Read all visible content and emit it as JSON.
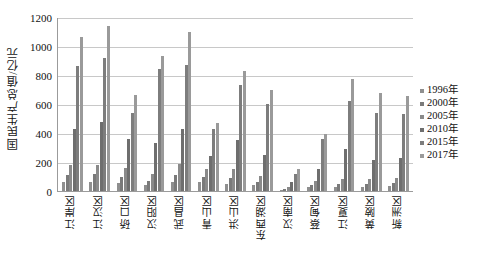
{
  "chart_data": {
    "type": "bar",
    "title": "",
    "subtitle": "",
    "xlabel": "",
    "ylabel": "国民生产总值/亿元",
    "ylim": [
      0,
      1200
    ],
    "ytick_values": [
      0,
      200,
      400,
      600,
      800,
      1000,
      1200
    ],
    "ytick_labels": [
      "0",
      "200",
      "400",
      "600",
      "800",
      "1000",
      "1200"
    ],
    "grid": true,
    "legend_position": "right",
    "categories": [
      "江岸区",
      "江汉区",
      "硚口区",
      "汉阳区",
      "武昌区",
      "青山区",
      "洪山区",
      "东西湖区",
      "汉南区",
      "蔡甸区",
      "江夏区",
      "黄陂区",
      "新洲区"
    ],
    "series": [
      {
        "name": "1996年",
        "color": "#8f8f8f",
        "values": [
          60,
          64,
          55,
          42,
          62,
          60,
          50,
          40,
          10,
          26,
          30,
          30,
          34
        ]
      },
      {
        "name": "2000年",
        "color": "#7a7a7a",
        "values": [
          110,
          120,
          100,
          70,
          110,
          100,
          88,
          62,
          14,
          40,
          46,
          48,
          52
        ]
      },
      {
        "name": "2005年",
        "color": "#8a8a8a",
        "values": [
          180,
          180,
          160,
          120,
          185,
          150,
          150,
          105,
          26,
          72,
          80,
          85,
          90
        ]
      },
      {
        "name": "2010年",
        "color": "#6e6e6e",
        "values": [
          425,
          475,
          360,
          330,
          430,
          240,
          350,
          245,
          60,
          150,
          290,
          215,
          230
        ]
      },
      {
        "name": "2015年",
        "color": "#7d7d7d",
        "values": [
          860,
          920,
          540,
          840,
          870,
          430,
          730,
          600,
          120,
          360,
          620,
          540,
          530
        ]
      },
      {
        "name": "2017年",
        "color": "#9a9a9a",
        "values": [
          1065,
          1140,
          660,
          930,
          1095,
          470,
          830,
          700,
          150,
          395,
          770,
          675,
          655
        ]
      }
    ]
  },
  "legend": {
    "items": [
      {
        "label": "1996年"
      },
      {
        "label": "2000年"
      },
      {
        "label": "2005年"
      },
      {
        "label": "2010年"
      },
      {
        "label": "2015年"
      },
      {
        "label": "2017年"
      }
    ]
  }
}
